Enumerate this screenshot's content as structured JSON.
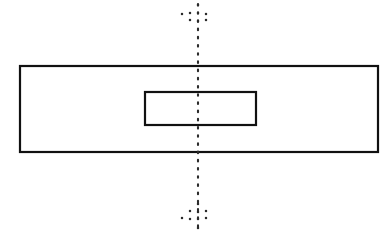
{
  "drawing": {
    "title": "Technical line drawing: rectangle with centered inner rectangle and vertical centerline",
    "canvas": {
      "width": 392,
      "height": 233,
      "background": "#ffffff"
    },
    "stroke_color": "#111111",
    "centerline_color": "#2b2b2b",
    "shapes": {
      "outer_rectangle": {
        "name": "outer-rectangle",
        "x": 20,
        "y": 66,
        "width": 358,
        "height": 86,
        "stroke_width": 2.2,
        "fill": "#ffffff"
      },
      "inner_rectangle": {
        "name": "inner-rectangle",
        "x": 145,
        "y": 92,
        "width": 111,
        "height": 33,
        "stroke_width": 2.2,
        "fill": "#ffffff"
      },
      "vertical_centerline": {
        "name": "vertical-centerline",
        "x": 198,
        "y_start": 4,
        "y_end": 229,
        "style": "dotted",
        "dot_spacing": 8.2,
        "stroke_width": 2.1
      }
    },
    "centerline_end_marks": {
      "top_cluster": [
        {
          "x": 198,
          "y": 5
        },
        {
          "x": 190,
          "y": 13
        },
        {
          "x": 198,
          "y": 13
        },
        {
          "x": 182,
          "y": 14
        },
        {
          "x": 206,
          "y": 14
        },
        {
          "x": 190,
          "y": 20
        },
        {
          "x": 206,
          "y": 20
        },
        {
          "x": 198,
          "y": 21
        }
      ],
      "bottom_cluster": [
        {
          "x": 198,
          "y": 204
        },
        {
          "x": 190,
          "y": 211
        },
        {
          "x": 206,
          "y": 211
        },
        {
          "x": 198,
          "y": 212
        },
        {
          "x": 182,
          "y": 218
        },
        {
          "x": 206,
          "y": 218
        },
        {
          "x": 190,
          "y": 219
        },
        {
          "x": 198,
          "y": 219
        },
        {
          "x": 198,
          "y": 228
        }
      ]
    }
  }
}
